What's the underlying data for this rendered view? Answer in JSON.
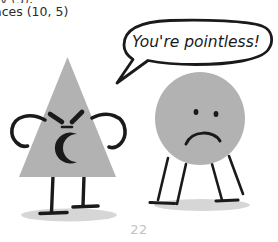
{
  "page": {
    "number": "22",
    "background_color": "#ffffff"
  },
  "body_text": {
    "clipped_line_above": "y (5),",
    "visible_line": "aces (10, 5)"
  },
  "illustration": {
    "title": "angry-triangle-insults-sad-circle",
    "style": "hand-drawn cartoon, grayscale",
    "ink_color": "#1a1a1a",
    "fill_color": "#b2b2b2",
    "shadow_color": "#c9c9c9",
    "speech_bubble": {
      "text": "You're pointless!",
      "speaker": "triangle",
      "tail_direction": "down-left"
    },
    "characters": [
      {
        "name": "triangle",
        "shape": "triangle",
        "expression": "angry",
        "mouth": "open-shout",
        "eyes": "angled-slits",
        "arms": "hands-on-hips",
        "legs": 2
      },
      {
        "name": "circle",
        "shape": "circle",
        "expression": "sad",
        "mouth": "frown",
        "eyes": "dots",
        "arms": "none",
        "legs": 4
      }
    ]
  }
}
